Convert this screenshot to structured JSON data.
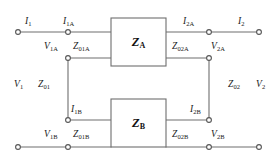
{
  "diagram": {
    "type": "circuit-schematic",
    "stroke_color": "#6e6e6e",
    "text_color": "#1a1a1a",
    "background": "#ffffff"
  },
  "blocks": [
    {
      "id": "block-a",
      "symbol": "Z",
      "subscript": "A",
      "x": 111,
      "y": 18,
      "w": 55,
      "h": 48
    },
    {
      "id": "block-b",
      "symbol": "Z",
      "subscript": "B",
      "x": 111,
      "y": 99,
      "w": 55,
      "h": 48
    }
  ],
  "labels": {
    "i1": {
      "symbol": "I",
      "sub": "1",
      "x": 25,
      "y": 17
    },
    "i1a": {
      "symbol": "I",
      "sub": "1A",
      "x": 63,
      "y": 17
    },
    "i2a": {
      "symbol": "I",
      "sub": "2A",
      "x": 183,
      "y": 17
    },
    "i2": {
      "symbol": "I",
      "sub": "2",
      "x": 238,
      "y": 17
    },
    "v1a": {
      "symbol": "V",
      "sub": "1A",
      "x": 44,
      "y": 42
    },
    "z01a": {
      "symbol": "Z",
      "sub": "01A",
      "x": 73,
      "y": 42
    },
    "z02a": {
      "symbol": "Z",
      "sub": "02A",
      "x": 172,
      "y": 42
    },
    "v2a": {
      "symbol": "V",
      "sub": "2A",
      "x": 211,
      "y": 42
    },
    "v1": {
      "symbol": "V",
      "sub": "1",
      "x": 14,
      "y": 80
    },
    "z01": {
      "symbol": "Z",
      "sub": "01",
      "x": 38,
      "y": 80
    },
    "z02": {
      "symbol": "Z",
      "sub": "02",
      "x": 228,
      "y": 80
    },
    "v2": {
      "symbol": "V",
      "sub": "2",
      "x": 256,
      "y": 80
    },
    "i1b": {
      "symbol": "I",
      "sub": "1B",
      "x": 71,
      "y": 105
    },
    "i2b": {
      "symbol": "I",
      "sub": "2B",
      "x": 190,
      "y": 105
    },
    "v1b": {
      "symbol": "V",
      "sub": "1B",
      "x": 44,
      "y": 130
    },
    "z01b": {
      "symbol": "Z",
      "sub": "01B",
      "x": 73,
      "y": 130
    },
    "z02b": {
      "symbol": "Z",
      "sub": "02B",
      "x": 172,
      "y": 130
    },
    "v2b": {
      "symbol": "V",
      "sub": "2B",
      "x": 211,
      "y": 130
    }
  },
  "terminals": [
    {
      "id": "terminal-i1-left",
      "x": 18,
      "y": 32
    },
    {
      "id": "terminal-i1a",
      "x": 68,
      "y": 32
    },
    {
      "id": "terminal-i2a",
      "x": 209,
      "y": 32
    },
    {
      "id": "terminal-i2-right",
      "x": 259,
      "y": 32
    },
    {
      "id": "terminal-v1a-node",
      "x": 68,
      "y": 58
    },
    {
      "id": "terminal-v2a-node",
      "x": 209,
      "y": 58
    },
    {
      "id": "terminal-i1b-node",
      "x": 68,
      "y": 120
    },
    {
      "id": "terminal-i2b-node",
      "x": 209,
      "y": 120
    },
    {
      "id": "terminal-v1b-left",
      "x": 18,
      "y": 147
    },
    {
      "id": "terminal-v1b-node",
      "x": 68,
      "y": 147
    },
    {
      "id": "terminal-v2b-node",
      "x": 209,
      "y": 147
    },
    {
      "id": "terminal-v2b-right",
      "x": 259,
      "y": 147
    }
  ],
  "wires": [
    {
      "id": "wire-i1-top",
      "x1": 18,
      "y1": 32,
      "x2": 111,
      "y2": 32
    },
    {
      "id": "wire-i2-top",
      "x1": 166,
      "y1": 32,
      "x2": 259,
      "y2": 32
    },
    {
      "id": "wire-v1a-to-block",
      "x1": 68,
      "y1": 58,
      "x2": 111,
      "y2": 58
    },
    {
      "id": "wire-v2a-to-block",
      "x1": 166,
      "y1": 58,
      "x2": 209,
      "y2": 58
    },
    {
      "id": "wire-i1b-to-block",
      "x1": 68,
      "y1": 120,
      "x2": 111,
      "y2": 120
    },
    {
      "id": "wire-i2b-to-block",
      "x1": 166,
      "y1": 120,
      "x2": 209,
      "y2": 120
    },
    {
      "id": "wire-v1b-bottom",
      "x1": 18,
      "y1": 147,
      "x2": 111,
      "y2": 147
    },
    {
      "id": "wire-v2b-bottom",
      "x1": 166,
      "y1": 147,
      "x2": 259,
      "y2": 147
    },
    {
      "id": "wire-left-vertical",
      "x1": 68,
      "y1": 58,
      "x2": 68,
      "y2": 120
    },
    {
      "id": "wire-right-vertical",
      "x1": 209,
      "y1": 58,
      "x2": 209,
      "y2": 120
    }
  ]
}
